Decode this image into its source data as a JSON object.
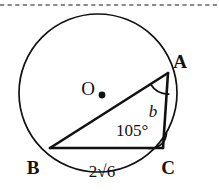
{
  "figure": {
    "background_color": "#ffffff",
    "stroke_color": "#111111",
    "dashed_rule_color": "#8a8a8a",
    "circle": {
      "label": "O",
      "center_label": "O",
      "center_x": 98,
      "center_y": 93,
      "radius": 79,
      "center_dot_x": 102,
      "center_dot_y": 95
    },
    "vertices": [
      {
        "name": "A",
        "label": "A",
        "x": 168,
        "y": 73,
        "label_x": 180,
        "label_y": 68
      },
      {
        "name": "B",
        "label": "B",
        "x": 50,
        "y": 148,
        "label_x": 33,
        "label_y": 174
      },
      {
        "name": "C",
        "label": "C",
        "x": 163,
        "y": 148,
        "label_x": 168,
        "label_y": 174
      }
    ],
    "sides": [
      {
        "name": "BC",
        "label": "2√6",
        "label_x": 93,
        "label_y": 176
      },
      {
        "name": "CA",
        "label": "b",
        "label_x": 152,
        "label_y": 116
      },
      {
        "name": "AB",
        "label": ""
      }
    ],
    "angles": [
      {
        "at": "C",
        "label": "105°",
        "label_x": 115,
        "label_y": 135,
        "value": 105,
        "unit": "degrees"
      },
      {
        "at": "A",
        "label": "",
        "value": null,
        "unit": "degrees"
      }
    ],
    "dashed_rule": {
      "y": 5,
      "x_start": 0,
      "x_end": 219
    }
  }
}
